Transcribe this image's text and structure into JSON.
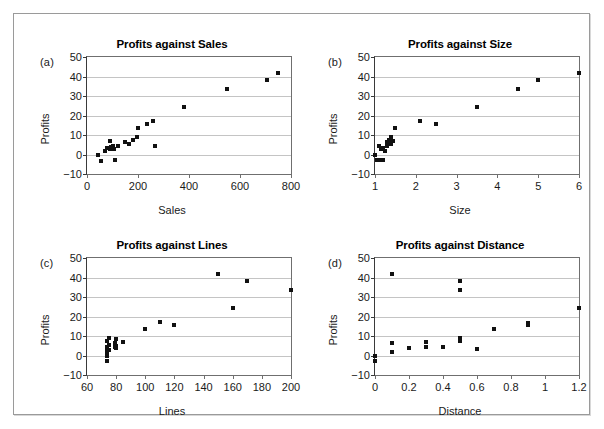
{
  "figure": {
    "background": "#ffffff",
    "frame_color": "#9a9a9a",
    "point_color": "#111111",
    "grid_color": "#c4c4c4",
    "axis_color": "#3a3a3a"
  },
  "chart_data": [
    {
      "type": "scatter",
      "panel": "(a)",
      "title": "Profits against Sales",
      "xlabel": "Sales",
      "ylabel": "Profits",
      "xlim": [
        0,
        800
      ],
      "ylim": [
        -10,
        50
      ],
      "xticks": [
        0,
        200,
        400,
        600,
        800
      ],
      "yticks": [
        -10,
        0,
        10,
        20,
        30,
        40,
        50
      ],
      "xticklabels": [
        "0",
        "200",
        "400",
        "600",
        "800"
      ],
      "yticklabels": [
        "−10",
        "0",
        "10",
        "20",
        "30",
        "40",
        "50"
      ],
      "grid": "horizontal",
      "legend": "none",
      "x": [
        45,
        55,
        70,
        80,
        90,
        92,
        95,
        100,
        105,
        110,
        120,
        150,
        165,
        180,
        195,
        200,
        235,
        260,
        265,
        380,
        550,
        705,
        750
      ],
      "y": [
        -0.5,
        -3.2,
        1.8,
        3.2,
        7.0,
        2.6,
        3.6,
        4.3,
        3.0,
        -3.0,
        4.6,
        6.2,
        5.4,
        7.6,
        8.9,
        13.8,
        15.5,
        17.2,
        4.3,
        24.2,
        33.4,
        38.3,
        42.0
      ]
    },
    {
      "type": "scatter",
      "panel": "(b)",
      "title": "Profits against Size",
      "xlabel": "Size",
      "ylabel": "Profits",
      "xlim": [
        1,
        6
      ],
      "ylim": [
        -10,
        50
      ],
      "xticks": [
        1,
        2,
        3,
        4,
        5,
        6
      ],
      "yticks": [
        -10,
        0,
        10,
        20,
        30,
        40,
        50
      ],
      "xticklabels": [
        "1",
        "2",
        "3",
        "4",
        "5",
        "6"
      ],
      "yticklabels": [
        "−10",
        "0",
        "10",
        "20",
        "30",
        "40",
        "50"
      ],
      "grid": "horizontal",
      "legend": "none",
      "x": [
        1.0,
        1.05,
        1.1,
        1.15,
        1.15,
        1.2,
        1.2,
        1.25,
        1.3,
        1.3,
        1.35,
        1.4,
        1.4,
        1.45,
        1.5,
        2.1,
        2.5,
        3.5,
        4.5,
        5.0,
        6.0
      ],
      "y": [
        -0.5,
        -3.0,
        4.3,
        -3.0,
        2.6,
        3.2,
        -2.8,
        1.8,
        4.6,
        6.2,
        7.6,
        5.4,
        8.9,
        7.0,
        13.8,
        17.2,
        15.5,
        24.2,
        33.4,
        38.3,
        42.0
      ]
    },
    {
      "type": "scatter",
      "panel": "(c)",
      "title": "Profits against Lines",
      "xlabel": "Lines",
      "ylabel": "Profits",
      "xlim": [
        60,
        200
      ],
      "ylim": [
        -10,
        50
      ],
      "xticks": [
        60,
        80,
        100,
        120,
        140,
        160,
        180,
        200
      ],
      "yticks": [
        -10,
        0,
        10,
        20,
        30,
        40,
        50
      ],
      "xticklabels": [
        "60",
        "80",
        "100",
        "120",
        "140",
        "160",
        "180",
        "200"
      ],
      "yticklabels": [
        "−10",
        "0",
        "10",
        "20",
        "30",
        "40",
        "50"
      ],
      "grid": "horizontal",
      "legend": "none",
      "x": [
        74,
        74,
        74,
        74,
        74,
        74,
        75,
        75,
        75,
        79,
        79,
        80,
        80,
        80,
        85,
        100,
        110,
        120,
        150,
        160,
        170,
        200
      ],
      "y": [
        -3.0,
        -0.5,
        1.8,
        3.2,
        4.6,
        7.6,
        2.6,
        5.4,
        8.9,
        4.3,
        6.2,
        3.6,
        5.0,
        8.4,
        7.0,
        13.8,
        17.2,
        15.5,
        42.0,
        24.2,
        38.3,
        33.4
      ]
    },
    {
      "type": "scatter",
      "panel": "(d)",
      "title": "Profits against Distance",
      "xlabel": "Distance",
      "ylabel": "Profits",
      "xlim": [
        0,
        1.2
      ],
      "ylim": [
        -10,
        50
      ],
      "xticks": [
        0,
        0.2,
        0.4,
        0.6,
        0.8,
        1.0,
        1.2
      ],
      "yticks": [
        -10,
        0,
        10,
        20,
        30,
        40,
        50
      ],
      "xticklabels": [
        "0",
        "0.2",
        "0.4",
        "0.6",
        "0.8",
        "1",
        "1.2"
      ],
      "yticklabels": [
        "−10",
        "0",
        "10",
        "20",
        "30",
        "40",
        "50"
      ],
      "grid": "horizontal",
      "legend": "none",
      "x": [
        0.0,
        0.0,
        0.1,
        0.1,
        0.1,
        0.2,
        0.3,
        0.3,
        0.4,
        0.5,
        0.5,
        0.5,
        0.5,
        0.6,
        0.7,
        0.9,
        0.9,
        1.2
      ],
      "y": [
        -0.5,
        -3.0,
        42.0,
        6.2,
        1.8,
        3.6,
        7.0,
        4.6,
        4.3,
        38.3,
        33.4,
        8.9,
        7.6,
        3.2,
        13.8,
        16.6,
        15.5,
        24.2
      ]
    }
  ]
}
